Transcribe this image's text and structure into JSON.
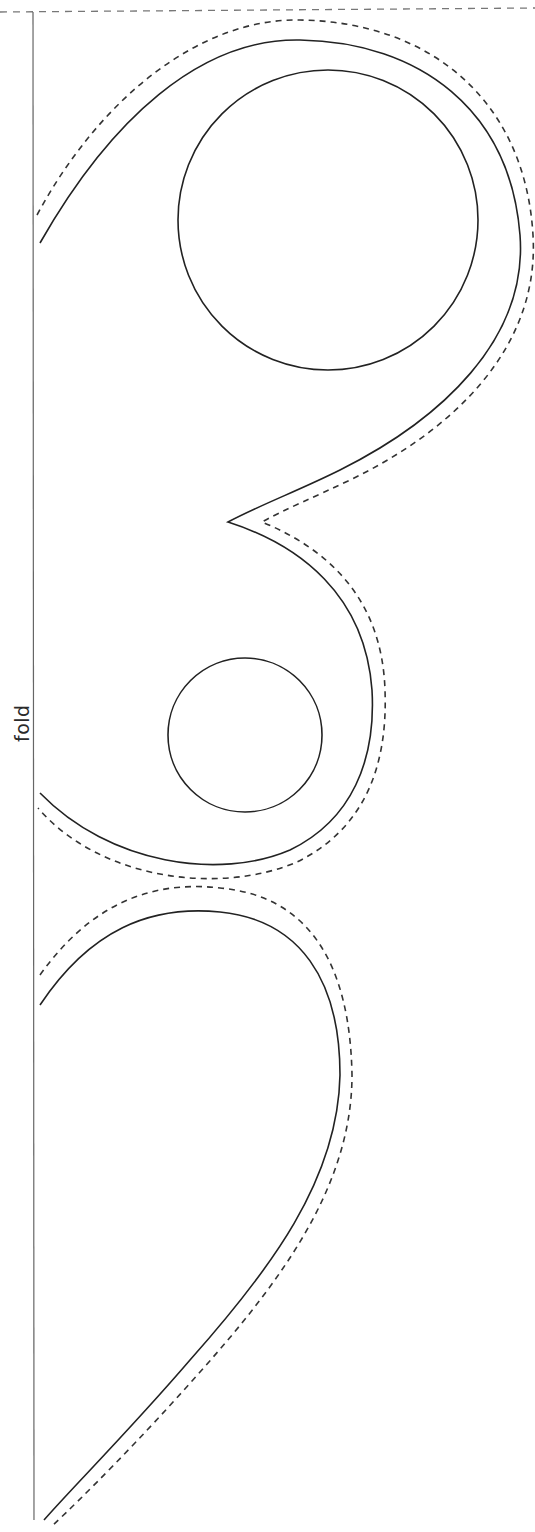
{
  "document": {
    "type": "sewing-pattern-template",
    "fold_label": "fold",
    "colors": {
      "background": "#ffffff",
      "cut_line": "#222222",
      "seam_line": "#333333",
      "fold_line": "#666666",
      "top_edge": "#777777"
    }
  },
  "shapes": {
    "top_edge": "M0 12 L535 8",
    "fold_line": "M33 12 L34 1520",
    "upper_piece_cut": "M40 243 C110 120 200 38 300 40 C420 42 510 110 520 235 C528 340 440 420 340 470 C300 490 260 505 228 522 C300 545 365 595 372 690 C376 760 352 820 290 850 C220 880 110 865 40 793",
    "upper_piece_seam": "M37 215 C100 98 200 18 300 20 C430 22 525 100 533 235 C540 350 450 432 350 480 C315 497 285 509 262 522 C330 550 382 600 385 690 C388 770 362 830 297 862 C220 895 100 880 38 808",
    "upper_hole_large": {
      "cx": 328,
      "cy": 220,
      "r": 150
    },
    "lower_hole_small": {
      "cx": 245,
      "cy": 735,
      "r": 77
    },
    "lower_piece_cut": "M40 1005 C90 930 150 905 220 912 C300 920 340 980 340 1075 C338 1180 270 1270 190 1360 C130 1430 70 1490 44 1520",
    "lower_piece_seam": "M40 975 C90 905 150 880 220 888 C310 896 350 965 352 1075 C352 1185 282 1280 200 1372 C140 1440 82 1498 52 1526"
  }
}
